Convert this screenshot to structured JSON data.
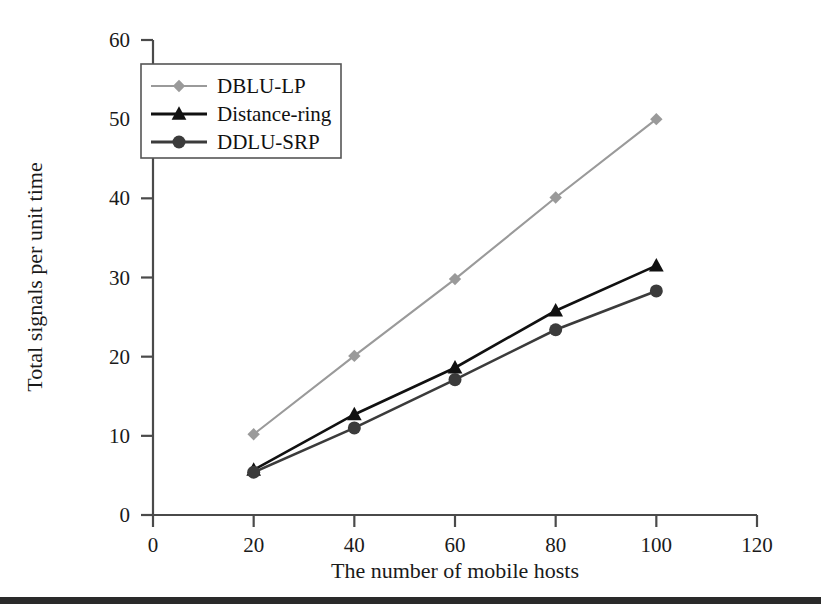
{
  "figure": {
    "background": "#ffffff",
    "footer_bar_color": "#2a2a2a"
  },
  "chart_data": {
    "type": "line",
    "title": "",
    "xlabel": "The number of mobile hosts",
    "ylabel": "Total signals per unit time",
    "xlim": [
      0,
      120
    ],
    "ylim": [
      0,
      60
    ],
    "xticks": [
      0,
      20,
      40,
      60,
      80,
      100,
      120
    ],
    "xtick_labels": [
      "0",
      "20",
      "40",
      "60",
      "80",
      "100",
      "120"
    ],
    "yticks": [
      0,
      10,
      20,
      30,
      40,
      50,
      60
    ],
    "ytick_labels": [
      "0",
      "10",
      "20",
      "30",
      "40",
      "50",
      "60"
    ],
    "grid": false,
    "legend_position": "upper left",
    "x": [
      20,
      40,
      60,
      80,
      100
    ],
    "series": [
      {
        "name": "DBLU-LP",
        "color": "#9a9a9a",
        "marker": "diamond",
        "values": [
          10.2,
          20.1,
          29.8,
          40.1,
          50.0
        ]
      },
      {
        "name": "Distance-ring",
        "color": "#111111",
        "marker": "triangle",
        "values": [
          5.7,
          12.7,
          18.6,
          25.8,
          31.5
        ]
      },
      {
        "name": "DDLU-SRP",
        "color": "#3b3b3b",
        "marker": "circle",
        "values": [
          5.4,
          11.0,
          17.1,
          23.4,
          28.3
        ]
      }
    ]
  },
  "legend": {
    "entries": [
      {
        "label": "DBLU-LP"
      },
      {
        "label": "Distance-ring"
      },
      {
        "label": "DDLU-SRP"
      }
    ]
  }
}
